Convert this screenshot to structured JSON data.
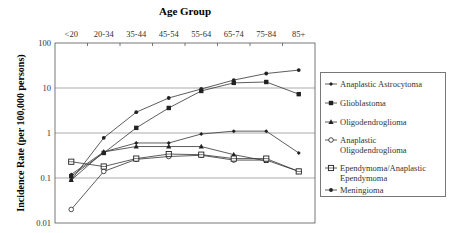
{
  "chart_data": {
    "type": "line",
    "title": "Age Group",
    "xlabel": "Age Group",
    "ylabel": "Incidence Rate (per 100,000 persons)",
    "yscale": "log",
    "ylim": [
      0.01,
      100
    ],
    "yticks": [
      "100",
      "10",
      "1",
      "0.1",
      "0.01"
    ],
    "grid": "horizontal major gridlines at 10, 1, 0.1",
    "x_axis_position": "top",
    "legend_position": "right",
    "categories": [
      "<20",
      "20-34",
      "35-44",
      "45-54",
      "55-64",
      "65-74",
      "75-84",
      "85+"
    ],
    "series": [
      {
        "name": "Anaplastic Astrocytoma",
        "marker": "small-diamond",
        "values": [
          0.12,
          0.38,
          0.6,
          0.6,
          0.95,
          1.1,
          1.1,
          0.36
        ]
      },
      {
        "name": "Glioblastoma",
        "marker": "filled-square",
        "values": [
          0.11,
          0.36,
          1.3,
          3.6,
          8.6,
          13,
          13.6,
          7.3
        ]
      },
      {
        "name": "Oligodendroglioma",
        "marker": "filled-triangle",
        "values": [
          0.09,
          0.38,
          0.5,
          0.5,
          0.5,
          0.33,
          0.24,
          null
        ]
      },
      {
        "name": "Anaplastic Oligodendroglioma",
        "marker": "open-circle",
        "values": [
          0.02,
          0.14,
          0.26,
          0.3,
          0.32,
          0.25,
          0.25,
          0.14
        ]
      },
      {
        "name": "Ependymoma/Anaplastic Ependymoma",
        "marker": "open-square",
        "values": [
          0.23,
          0.18,
          0.27,
          0.34,
          0.33,
          0.27,
          0.27,
          0.14
        ]
      },
      {
        "name": "Meningioma",
        "marker": "filled-circle",
        "values": [
          0.09,
          0.78,
          2.9,
          6,
          9.5,
          15,
          21,
          25
        ]
      }
    ]
  },
  "legend": {
    "items": [
      {
        "lines": [
          "Anaplastic Astrocytoma"
        ]
      },
      {
        "lines": [
          "Glioblastoma"
        ]
      },
      {
        "lines": [
          "Oligodendroglioma"
        ]
      },
      {
        "lines": [
          "Anaplastic",
          "Oligodendroglioma"
        ]
      },
      {
        "lines": [
          "Ependymoma/Anaplastic",
          "Ependymoma"
        ]
      },
      {
        "lines": [
          "Meningioma"
        ]
      }
    ]
  },
  "colors": {
    "line": "#333333",
    "grid": "#888888",
    "axis": "#555555"
  }
}
